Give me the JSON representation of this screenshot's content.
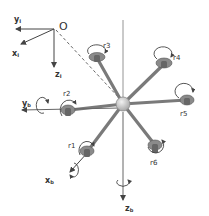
{
  "diagram": {
    "inertial_frame": {
      "origin_label": "O",
      "x_label": "xI",
      "y_label": "yI",
      "z_label": "zI"
    },
    "body_frame": {
      "x_label": "xb",
      "y_label": "yb",
      "z_label": "zb"
    },
    "rotors": [
      {
        "id": "r1",
        "label": "r1"
      },
      {
        "id": "r2",
        "label": "r2"
      },
      {
        "id": "r3",
        "label": "r3"
      },
      {
        "id": "r4",
        "label": "r4"
      },
      {
        "id": "r5",
        "label": "r5"
      },
      {
        "id": "r6",
        "label": "r6"
      }
    ],
    "colors": {
      "arm": "#7a7a7a",
      "hub": "#d9d9d9",
      "motor": "#6e6e6e",
      "axis": "#444444",
      "text": "#333333"
    }
  }
}
